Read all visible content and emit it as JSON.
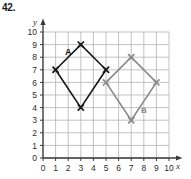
{
  "problem": {
    "number": "42."
  },
  "chart_data": {
    "type": "scatter",
    "title": "",
    "xlabel": "x",
    "ylabel": "y",
    "xlim": [
      0,
      10
    ],
    "ylim": [
      0,
      10
    ],
    "grid": true,
    "legend": "none",
    "x_ticks": [
      "0",
      "1",
      "2",
      "3",
      "4",
      "5",
      "6",
      "7",
      "8",
      "9",
      "10"
    ],
    "y_ticks": [
      "0",
      "1",
      "2",
      "3",
      "4",
      "5",
      "6",
      "7",
      "8",
      "9",
      "10"
    ],
    "series": [
      {
        "name": "A",
        "label": "A",
        "color": "#161616",
        "marker": "x",
        "closed": true,
        "label_point": [
          2.0,
          8.2
        ],
        "points": [
          [
            1,
            7
          ],
          [
            3,
            9
          ],
          [
            5,
            7
          ],
          [
            3,
            4
          ]
        ]
      },
      {
        "name": "B",
        "label": "B",
        "color": "#8a8a8a",
        "marker": "x",
        "closed": true,
        "label_point": [
          8.0,
          3.6
        ],
        "points": [
          [
            5,
            6
          ],
          [
            7,
            8
          ],
          [
            9,
            6
          ],
          [
            7,
            3
          ]
        ]
      }
    ]
  },
  "style": {
    "grid_color": "#b4b4b4",
    "axis_color": "#3a3a3a",
    "background": "#ffffff"
  }
}
